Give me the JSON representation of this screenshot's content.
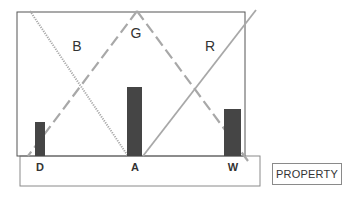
{
  "diagram": {
    "region_labels": [
      {
        "id": "B",
        "text": "B",
        "x": 77,
        "y": 46
      },
      {
        "id": "G",
        "text": "G",
        "x": 136,
        "y": 33
      },
      {
        "id": "R",
        "text": "R",
        "x": 210,
        "y": 46
      }
    ],
    "axis_labels": [
      {
        "id": "D",
        "text": "D",
        "x": 40,
        "y": 167
      },
      {
        "id": "A",
        "text": "A",
        "x": 135,
        "y": 167
      },
      {
        "id": "W",
        "text": "W",
        "x": 233,
        "y": 167
      }
    ],
    "bars": [
      {
        "id": "D",
        "x": 35,
        "width": 10,
        "top": 122,
        "bottom": 156
      },
      {
        "id": "A",
        "x": 127,
        "width": 15,
        "top": 87,
        "bottom": 156
      },
      {
        "id": "W",
        "x": 224,
        "width": 17,
        "top": 109,
        "bottom": 156
      }
    ],
    "lines": [
      {
        "id": "B-line",
        "style": "dotted",
        "x1": 30,
        "y1": 11,
        "x2": 128,
        "y2": 156
      },
      {
        "id": "G-left",
        "style": "dashed",
        "x1": 137,
        "y1": 11,
        "x2": 28,
        "y2": 156
      },
      {
        "id": "G-right",
        "style": "dashed",
        "x1": 137,
        "y1": 11,
        "x2": 248,
        "y2": 161
      },
      {
        "id": "R-line",
        "style": "solid",
        "x1": 143,
        "y1": 156,
        "x2": 256,
        "y2": 10
      }
    ],
    "property_box": {
      "label": "PROPERTY"
    },
    "colors": {
      "frame": "#555555",
      "bar": "#454545",
      "line": "#a8a8a8",
      "text": "#333333"
    }
  }
}
